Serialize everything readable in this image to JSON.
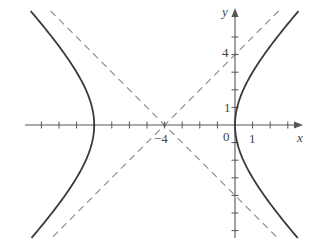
{
  "figure": {
    "type": "hyperbola-plot",
    "equation": "(x+4)^2/16 - y^2/16 = 1",
    "center": [
      -4,
      0
    ],
    "a": 4,
    "b": 4,
    "asymptotes": [
      "y = x + 4",
      "y = -(x + 4)"
    ],
    "vertices": [
      [
        -8,
        0
      ],
      [
        0,
        0
      ]
    ]
  },
  "axes": {
    "x_label": "x",
    "y_label": "y",
    "origin_label": "0",
    "x_tick_labels": [
      {
        "value": -4,
        "text": "−4"
      },
      {
        "value": 1,
        "text": "1"
      }
    ],
    "y_tick_labels": [
      {
        "value": 1,
        "text": "1"
      },
      {
        "value": 4,
        "text": "4"
      }
    ],
    "x_range": [
      -12,
      4
    ],
    "y_range": [
      -6,
      6
    ],
    "tick_step": 1
  },
  "colors": {
    "axis": "#555555",
    "curve": "#3a3a3a",
    "asymptote": "#8a8a8a",
    "text": "#444444",
    "background": "#ffffff"
  },
  "layout": {
    "origin_px": [
      235,
      125
    ],
    "unit_px": 17.6,
    "x_axis_px": [
      25,
      303
    ],
    "y_axis_px": [
      8,
      238
    ],
    "y_clip_px": [
      11,
      238
    ]
  }
}
